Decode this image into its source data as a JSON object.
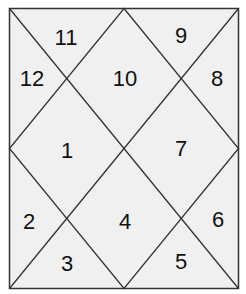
{
  "chart": {
    "frame": {
      "x1": 9,
      "y1": 8,
      "x2": 238,
      "y2": 288
    },
    "colors": {
      "fill": "#f0f0f0",
      "line": "#333333",
      "text": "#111111"
    },
    "houses": [
      {
        "id": "house-11",
        "label": "11",
        "x": 66,
        "y": 38
      },
      {
        "id": "house-9",
        "label": "9",
        "x": 181,
        "y": 36
      },
      {
        "id": "house-12",
        "label": "12",
        "x": 32,
        "y": 79
      },
      {
        "id": "house-10",
        "label": "10",
        "x": 125,
        "y": 79
      },
      {
        "id": "house-8",
        "label": "8",
        "x": 217,
        "y": 79
      },
      {
        "id": "house-1",
        "label": "1",
        "x": 67,
        "y": 151
      },
      {
        "id": "house-7",
        "label": "7",
        "x": 181,
        "y": 149
      },
      {
        "id": "house-2",
        "label": "2",
        "x": 29,
        "y": 222
      },
      {
        "id": "house-4",
        "label": "4",
        "x": 125,
        "y": 222
      },
      {
        "id": "house-6",
        "label": "6",
        "x": 218,
        "y": 220
      },
      {
        "id": "house-3",
        "label": "3",
        "x": 67,
        "y": 264
      },
      {
        "id": "house-5",
        "label": "5",
        "x": 181,
        "y": 262
      }
    ]
  }
}
